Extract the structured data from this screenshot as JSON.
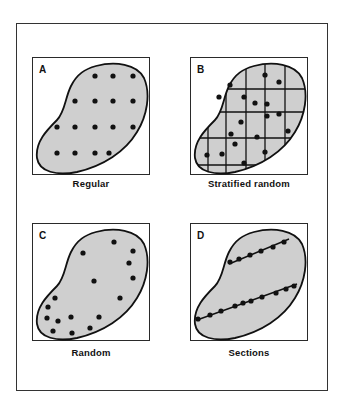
{
  "figure": {
    "panels": [
      {
        "letter": "A",
        "caption": "Regular",
        "dots": [
          [
            62,
            18
          ],
          [
            80,
            18
          ],
          [
            100,
            18
          ],
          [
            42,
            43
          ],
          [
            62,
            43
          ],
          [
            80,
            43
          ],
          [
            100,
            43
          ],
          [
            24,
            69
          ],
          [
            42,
            69
          ],
          [
            62,
            69
          ],
          [
            80,
            69
          ],
          [
            100,
            69
          ],
          [
            24,
            95
          ],
          [
            42,
            95
          ],
          [
            62,
            95
          ],
          [
            76,
            95
          ]
        ],
        "grid": false,
        "sections": []
      },
      {
        "letter": "B",
        "caption": "Stratified random",
        "dots": [
          [
            74,
            17
          ],
          [
            39,
            27
          ],
          [
            88,
            24
          ],
          [
            53,
            39
          ],
          [
            28,
            39
          ],
          [
            64,
            45
          ],
          [
            76,
            46
          ],
          [
            76,
            58
          ],
          [
            88,
            56
          ],
          [
            50,
            64
          ],
          [
            40,
            76
          ],
          [
            66,
            79
          ],
          [
            97,
            73
          ],
          [
            44,
            86
          ],
          [
            16,
            97
          ],
          [
            31,
            96
          ],
          [
            53,
            105
          ],
          [
            74,
            94
          ]
        ],
        "grid": true,
        "grid_v": [
          17,
          35,
          55,
          74,
          94
        ],
        "grid_h": [
          31,
          54,
          80,
          107
        ],
        "sections": []
      },
      {
        "letter": "C",
        "caption": "Random",
        "dots": [
          [
            81,
            18
          ],
          [
            50,
            29
          ],
          [
            100,
            27
          ],
          [
            96,
            39
          ],
          [
            100,
            54
          ],
          [
            61,
            57
          ],
          [
            87,
            74
          ],
          [
            22,
            74
          ],
          [
            15,
            83
          ],
          [
            14,
            94
          ],
          [
            25,
            97
          ],
          [
            38,
            93
          ],
          [
            66,
            93
          ],
          [
            20,
            107
          ],
          [
            39,
            109
          ],
          [
            57,
            104
          ]
        ],
        "grid": false,
        "sections": []
      },
      {
        "letter": "D",
        "caption": "Sections",
        "dots": [
          [
            39,
            38
          ],
          [
            48,
            35
          ],
          [
            59,
            31
          ],
          [
            70,
            27
          ],
          [
            82,
            23
          ],
          [
            93,
            18
          ],
          [
            7,
            95
          ],
          [
            19,
            91
          ],
          [
            30,
            87
          ],
          [
            44,
            82
          ],
          [
            52,
            79
          ],
          [
            60,
            77
          ],
          [
            71,
            73
          ],
          [
            85,
            69
          ],
          [
            95,
            65
          ],
          [
            103,
            62
          ]
        ],
        "grid": false,
        "sections": [
          [
            [
              6,
              96
            ],
            [
              106,
              60
            ]
          ],
          [
            [
              38,
              40
            ],
            [
              98,
              15
            ]
          ]
        ]
      }
    ]
  },
  "colors": {
    "fill": "#cfcfcf",
    "outline": "#111111",
    "dot": "#111111",
    "frame": "#333333"
  }
}
